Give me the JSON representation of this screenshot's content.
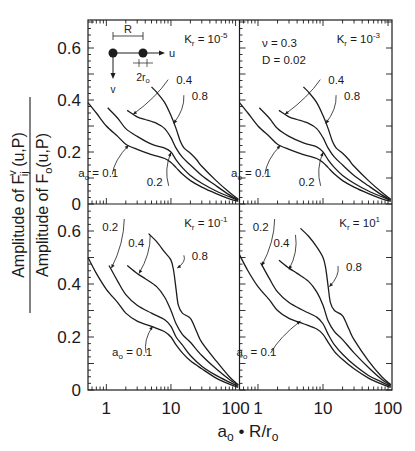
{
  "figure": {
    "xlabel_main": "a",
    "xlabel_sub": "o",
    "xlabel_rest": " • R/r",
    "xlabel_sub2": "o",
    "ylabel_numerator": "Amplitude of F",
    "ylabel_numerator_sup": "v",
    "ylabel_numerator_sub": "ij",
    "ylabel_numerator_tail": " (u,P)",
    "ylabel_denominator": "Amplitude of F",
    "ylabel_denominator_sub": "o",
    "ylabel_denominator_tail": "(u,P)",
    "inset": {
      "R_label": "R",
      "u_label": "u",
      "v_label": "v",
      "r_label": "2r",
      "r_sub": "o"
    },
    "params": {
      "nu_label": "ν = 0.3",
      "D_label": "D = 0.02"
    }
  },
  "chart_data": {
    "type": "line",
    "title": "",
    "xlabel": "a_o · R/r_o",
    "ylabel": "Amplitude of F_ij^v(u,P) / Amplitude of F_o(u,P)",
    "xscale": "log",
    "xlim": [
      0.52,
      115
    ],
    "ylim": [
      0,
      0.7
    ],
    "xticks": [
      1,
      10,
      100
    ],
    "xtick_labels": [
      "1",
      "10",
      "100"
    ],
    "yticks": [
      0,
      0.2,
      0.4,
      0.6
    ],
    "ytick_labels": [
      "0",
      "0.2",
      "0.4",
      "0.6"
    ],
    "grid": false,
    "legend": "inline curve labels (a_o = 0.1, 0.2, 0.4, 0.8)",
    "panels": [
      {
        "position": "top-left",
        "kr_label": "K",
        "kr_sub": "r",
        "kr_value": " = 10",
        "kr_exp": "-5",
        "series": [
          {
            "name": "a_o = 0.1",
            "x": [
              0.52,
              0.7,
              1,
              1.5,
              2,
              3,
              5,
              8,
              10,
              12,
              15,
              20,
              30,
              50,
              80,
              110
            ],
            "y": [
              0.39,
              0.35,
              0.3,
              0.26,
              0.23,
              0.21,
              0.19,
              0.175,
              0.16,
              0.14,
              0.115,
              0.09,
              0.065,
              0.04,
              0.02,
              0.01
            ]
          },
          {
            "name": "a_o = 0.2",
            "x": [
              1.05,
              1.5,
              2,
              3,
              5,
              8,
              10,
              12,
              15,
              20,
              30,
              50,
              80,
              110
            ],
            "y": [
              0.37,
              0.33,
              0.29,
              0.26,
              0.23,
              0.215,
              0.2,
              0.17,
              0.14,
              0.11,
              0.08,
              0.05,
              0.028,
              0.014
            ]
          },
          {
            "name": "a_o = 0.4",
            "x": [
              2.1,
              3,
              4,
              6,
              8,
              10,
              12,
              15,
              20,
              30,
              50,
              80,
              110
            ],
            "y": [
              0.36,
              0.335,
              0.325,
              0.31,
              0.29,
              0.255,
              0.215,
              0.18,
              0.15,
              0.11,
              0.07,
              0.035,
              0.016
            ]
          },
          {
            "name": "a_o = 0.8",
            "x": [
              5,
              6,
              8,
              10,
              12,
              14,
              16,
              20,
              25,
              30,
              50,
              80,
              110
            ],
            "y": [
              0.45,
              0.43,
              0.39,
              0.34,
              0.29,
              0.24,
              0.215,
              0.195,
              0.17,
              0.145,
              0.09,
              0.045,
              0.018
            ]
          }
        ],
        "curve_labels": [
          {
            "text": "a",
            "sub": "o",
            "tail": " = 0.1",
            "lx": 0.75,
            "ly": 0.105,
            "ax": 2.2,
            "ay": 0.225
          },
          {
            "text": "0.2",
            "lx": 5.6,
            "ly": 0.07,
            "ax": 10,
            "ay": 0.198
          },
          {
            "text": "0.4",
            "lx": 16,
            "ly": 0.46,
            "ax": 2.6,
            "ay": 0.345
          },
          {
            "text": "0.8",
            "lx": 28,
            "ly": 0.4,
            "ax": 11,
            "ay": 0.31
          }
        ]
      },
      {
        "position": "top-right",
        "kr_label": "K",
        "kr_sub": "r",
        "kr_value": " = 10",
        "kr_exp": "-3",
        "series": [
          {
            "name": "a_o = 0.1",
            "x": [
              0.52,
              0.7,
              1,
              1.5,
              2,
              3,
              5,
              8,
              10,
              12,
              15,
              20,
              30,
              50,
              80,
              110
            ],
            "y": [
              0.39,
              0.35,
              0.3,
              0.26,
              0.23,
              0.21,
              0.19,
              0.175,
              0.16,
              0.14,
              0.115,
              0.09,
              0.065,
              0.04,
              0.02,
              0.01
            ]
          },
          {
            "name": "a_o = 0.2",
            "x": [
              1.05,
              1.5,
              2,
              3,
              5,
              8,
              10,
              12,
              15,
              20,
              30,
              50,
              80,
              110
            ],
            "y": [
              0.37,
              0.33,
              0.29,
              0.26,
              0.235,
              0.22,
              0.2,
              0.17,
              0.14,
              0.11,
              0.08,
              0.05,
              0.028,
              0.014
            ]
          },
          {
            "name": "a_o = 0.4",
            "x": [
              2.1,
              3,
              4,
              6,
              8,
              10,
              12,
              15,
              20,
              30,
              50,
              80,
              110
            ],
            "y": [
              0.36,
              0.335,
              0.325,
              0.31,
              0.29,
              0.255,
              0.215,
              0.18,
              0.15,
              0.11,
              0.07,
              0.035,
              0.016
            ]
          },
          {
            "name": "a_o = 0.8",
            "x": [
              5,
              6,
              8,
              10,
              12,
              14,
              16,
              20,
              25,
              30,
              50,
              80,
              110
            ],
            "y": [
              0.45,
              0.43,
              0.39,
              0.34,
              0.29,
              0.24,
              0.215,
              0.195,
              0.17,
              0.145,
              0.09,
              0.045,
              0.018
            ]
          }
        ],
        "curve_labels": [
          {
            "text": "a",
            "sub": "o",
            "tail": " = 0.1",
            "lx": 0.78,
            "ly": 0.105,
            "ax": 2.2,
            "ay": 0.225
          },
          {
            "text": "0.2",
            "lx": 5.6,
            "ly": 0.07,
            "ax": 10,
            "ay": 0.198
          },
          {
            "text": "0.4",
            "lx": 16,
            "ly": 0.46,
            "ax": 2.6,
            "ay": 0.345
          },
          {
            "text": "0.8",
            "lx": 28,
            "ly": 0.4,
            "ax": 11,
            "ay": 0.31
          }
        ]
      },
      {
        "position": "bottom-left",
        "kr_label": "K",
        "kr_sub": "r",
        "kr_value": " = 10",
        "kr_exp": "-1",
        "series": [
          {
            "name": "a_o = 0.1",
            "x": [
              0.52,
              0.7,
              1,
              1.5,
              2,
              3,
              5,
              8,
              10,
              12,
              15,
              20,
              30,
              50,
              80,
              110
            ],
            "y": [
              0.5,
              0.44,
              0.38,
              0.33,
              0.29,
              0.26,
              0.24,
              0.22,
              0.2,
              0.17,
              0.14,
              0.11,
              0.08,
              0.045,
              0.022,
              0.01
            ]
          },
          {
            "name": "a_o = 0.2",
            "x": [
              1.1,
              1.5,
              2,
              3,
              5,
              8,
              10,
              12,
              15,
              20,
              30,
              50,
              80,
              110
            ],
            "y": [
              0.47,
              0.41,
              0.36,
              0.32,
              0.29,
              0.265,
              0.24,
              0.2,
              0.17,
              0.13,
              0.09,
              0.055,
              0.03,
              0.014
            ]
          },
          {
            "name": "a_o = 0.4",
            "x": [
              2.1,
              3,
              4,
              6,
              8,
              10,
              12,
              15,
              20,
              30,
              50,
              80,
              110
            ],
            "y": [
              0.47,
              0.44,
              0.42,
              0.39,
              0.35,
              0.3,
              0.25,
              0.21,
              0.18,
              0.13,
              0.08,
              0.04,
              0.018
            ]
          },
          {
            "name": "a_o = 0.8",
            "x": [
              4.5,
              6,
              8,
              10,
              11,
              12,
              13,
              15,
              20,
              25,
              30,
              50,
              80,
              110
            ],
            "y": [
              0.59,
              0.56,
              0.52,
              0.49,
              0.45,
              0.38,
              0.32,
              0.29,
              0.27,
              0.22,
              0.18,
              0.11,
              0.05,
              0.02
            ]
          }
        ],
        "curve_labels": [
          {
            "text": "a",
            "sub": "o",
            "tail": " = 0.1",
            "lx": 2.5,
            "ly": 0.13,
            "ax": 5.2,
            "ay": 0.24
          },
          {
            "text": "0.2",
            "lx": 1.15,
            "ly": 0.6,
            "ax": 1.2,
            "ay": 0.46
          },
          {
            "text": "0.4",
            "lx": 2.9,
            "ly": 0.54,
            "ax": 3.2,
            "ay": 0.44
          },
          {
            "text": "0.8",
            "lx": 28,
            "ly": 0.49,
            "ax": 12.5,
            "ay": 0.46
          }
        ]
      },
      {
        "position": "bottom-right",
        "kr_label": "K",
        "kr_sub": "r",
        "kr_value": " = 10",
        "kr_exp": "1",
        "series": [
          {
            "name": "a_o = 0.1",
            "x": [
              0.52,
              0.7,
              1,
              1.5,
              2,
              3,
              5,
              8,
              10,
              12,
              15,
              20,
              30,
              50,
              80,
              110
            ],
            "y": [
              0.51,
              0.45,
              0.39,
              0.34,
              0.3,
              0.27,
              0.25,
              0.23,
              0.21,
              0.18,
              0.145,
              0.115,
              0.08,
              0.045,
              0.022,
              0.01
            ]
          },
          {
            "name": "a_o = 0.2",
            "x": [
              1.1,
              1.5,
              2,
              3,
              5,
              8,
              10,
              12,
              15,
              20,
              30,
              50,
              80,
              110
            ],
            "y": [
              0.48,
              0.42,
              0.37,
              0.33,
              0.3,
              0.275,
              0.25,
              0.21,
              0.17,
              0.135,
              0.095,
              0.055,
              0.03,
              0.014
            ]
          },
          {
            "name": "a_o = 0.4",
            "x": [
              2.1,
              3,
              4,
              6,
              8,
              10,
              12,
              15,
              20,
              30,
              50,
              80,
              110
            ],
            "y": [
              0.49,
              0.46,
              0.44,
              0.41,
              0.37,
              0.32,
              0.26,
              0.22,
              0.19,
              0.14,
              0.085,
              0.04,
              0.018
            ]
          },
          {
            "name": "a_o = 0.8",
            "x": [
              4.5,
              6,
              8,
              10,
              11,
              12,
              13,
              15,
              20,
              25,
              30,
              50,
              80,
              110
            ],
            "y": [
              0.61,
              0.58,
              0.54,
              0.5,
              0.46,
              0.39,
              0.33,
              0.3,
              0.28,
              0.23,
              0.19,
              0.11,
              0.05,
              0.02
            ]
          }
        ],
        "curve_labels": [
          {
            "text": "a",
            "sub": "o",
            "tail": " = 0.1",
            "lx": 0.95,
            "ly": 0.13,
            "ax": 4.5,
            "ay": 0.26
          },
          {
            "text": "0.2",
            "lx": 1.1,
            "ly": 0.6,
            "ax": 1.15,
            "ay": 0.47
          },
          {
            "text": "0.4",
            "lx": 2.3,
            "ly": 0.54,
            "ax": 3.0,
            "ay": 0.455
          },
          {
            "text": "0.8",
            "lx": 30,
            "ly": 0.45,
            "ax": 12.5,
            "ay": 0.39
          }
        ]
      }
    ]
  }
}
